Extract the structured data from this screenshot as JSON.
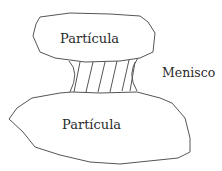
{
  "diagram": {
    "type": "particle-meniscus",
    "labels": {
      "top_particle": "Partícula",
      "bottom_particle": "Partícula",
      "meniscus": "Menisco"
    },
    "colors": {
      "stroke": "#555555",
      "text": "#2a2a2a",
      "background": "#ffffff"
    }
  }
}
